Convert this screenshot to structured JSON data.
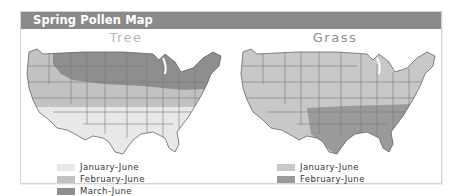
{
  "header": {
    "title": "Spring Pollen Map"
  },
  "maps": [
    {
      "title": "Tree",
      "legend": [
        {
          "label": "January-June",
          "color": "#e8e8e8"
        },
        {
          "label": "February-June",
          "color": "#c2c2c2"
        },
        {
          "label": "March-June",
          "color": "#8e8e8e"
        }
      ]
    },
    {
      "title": "Grass",
      "legend": [
        {
          "label": "January-June",
          "color": "#c8c8c8"
        },
        {
          "label": "February-June",
          "color": "#9a9a9a"
        }
      ]
    }
  ],
  "colors": {
    "header_bg": "#8a8a8a",
    "state_border": "#777777"
  }
}
